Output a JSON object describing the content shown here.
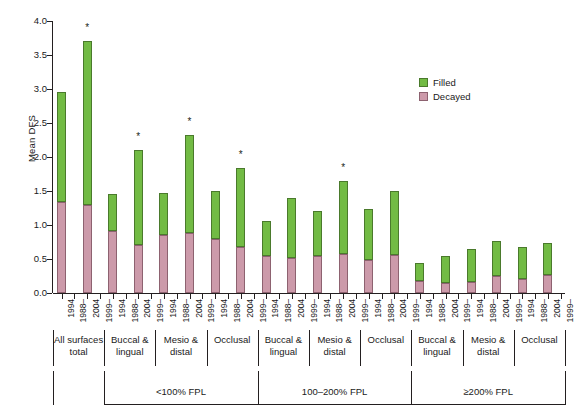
{
  "chart_data": {
    "type": "bar",
    "subtype": "stacked-bar",
    "title": "",
    "xlabel": "",
    "ylabel": "Mean DFS",
    "ylim": [
      0.0,
      4.0
    ],
    "ytick_labels": [
      "0.0",
      "0.5",
      "1.0",
      "1.5",
      "2.0",
      "2.5",
      "3.0",
      "3.5",
      "4.0"
    ],
    "ytick_values": [
      0.0,
      0.5,
      1.0,
      1.5,
      2.0,
      2.5,
      3.0,
      3.5,
      4.0
    ],
    "grid": false,
    "legend_position": "upper right",
    "series": [
      {
        "name": "Filled",
        "color": "#72bb44"
      },
      {
        "name": "Decayed",
        "color": "#cc9aaa"
      }
    ],
    "annotation_note": "* denotes statistically significant change",
    "categories": [
      "1994",
      "1988–",
      "2004",
      "1999–"
    ],
    "groups": [
      {
        "income": "",
        "surface_groups": [
          {
            "surface": "All surfaces total",
            "bars": [
              {
                "year": "1994",
                "decayed": 1.34,
                "filled": 1.61,
                "total": 2.95,
                "star": false
              },
              {
                "year": "1988–",
                "decayed": 0.0,
                "filled": 0.0,
                "total": 0.0,
                "star": false,
                "spacer": true
              },
              {
                "year": "2004",
                "decayed": 1.29,
                "filled": 2.42,
                "total": 3.71,
                "star": true
              },
              {
                "year": "1999–",
                "decayed": 0.0,
                "filled": 0.0,
                "total": 0.0,
                "star": false,
                "spacer": true
              }
            ]
          }
        ]
      },
      {
        "income": "<100% FPL",
        "surface_groups": [
          {
            "surface": "Buccal & lingual",
            "bars": [
              {
                "year": "1994",
                "decayed": 0.91,
                "filled": 0.55,
                "total": 1.46,
                "star": false
              },
              {
                "year": "1988–",
                "spacer": true
              },
              {
                "year": "2004",
                "decayed": 0.7,
                "filled": 1.41,
                "total": 2.11,
                "star": true
              },
              {
                "year": "1999–",
                "spacer": true
              }
            ]
          },
          {
            "surface": "Mesio & distal",
            "bars": [
              {
                "year": "1994",
                "decayed": 0.86,
                "filled": 0.61,
                "total": 1.47,
                "star": false
              },
              {
                "year": "1988–",
                "spacer": true
              },
              {
                "year": "2004",
                "decayed": 0.88,
                "filled": 1.45,
                "total": 2.33,
                "star": true
              },
              {
                "year": "1999–",
                "spacer": true
              }
            ]
          },
          {
            "surface": "Occlusal",
            "bars": [
              {
                "year": "1994",
                "decayed": 0.8,
                "filled": 0.7,
                "total": 1.5,
                "star": false
              },
              {
                "year": "1988–",
                "spacer": true
              },
              {
                "year": "2004",
                "decayed": 0.67,
                "filled": 1.17,
                "total": 1.84,
                "star": true
              },
              {
                "year": "1999–",
                "spacer": true
              }
            ]
          }
        ]
      },
      {
        "income": "100–200% FPL",
        "surface_groups": [
          {
            "surface": "Buccal & lingual",
            "bars": [
              {
                "year": "1994",
                "decayed": 0.54,
                "filled": 0.52,
                "total": 1.06,
                "star": false
              },
              {
                "year": "1988–",
                "spacer": true
              },
              {
                "year": "2004",
                "decayed": 0.52,
                "filled": 0.88,
                "total": 1.4,
                "star": false
              },
              {
                "year": "1999–",
                "spacer": true
              }
            ]
          },
          {
            "surface": "Mesio & distal",
            "bars": [
              {
                "year": "1994",
                "decayed": 0.55,
                "filled": 0.65,
                "total": 1.2,
                "star": false
              },
              {
                "year": "1988–",
                "spacer": true
              },
              {
                "year": "2004",
                "decayed": 0.57,
                "filled": 1.08,
                "total": 1.65,
                "star": true
              },
              {
                "year": "1999–",
                "spacer": true
              }
            ]
          },
          {
            "surface": "Occlusal",
            "bars": [
              {
                "year": "1994",
                "decayed": 0.48,
                "filled": 0.75,
                "total": 1.23,
                "star": false
              },
              {
                "year": "1988–",
                "spacer": true
              },
              {
                "year": "2004",
                "decayed": 0.56,
                "filled": 0.94,
                "total": 1.5,
                "star": false
              },
              {
                "year": "1999–",
                "spacer": true
              }
            ]
          }
        ]
      },
      {
        "income": "≥200% FPL",
        "surface_groups": [
          {
            "surface": "Buccal & lingual",
            "bars": [
              {
                "year": "1994",
                "decayed": 0.17,
                "filled": 0.27,
                "total": 0.44,
                "star": false
              },
              {
                "year": "1988–",
                "spacer": true
              },
              {
                "year": "2004",
                "decayed": 0.14,
                "filled": 0.41,
                "total": 0.55,
                "star": false
              },
              {
                "year": "1999–",
                "spacer": true
              }
            ]
          },
          {
            "surface": "Mesio & distal",
            "bars": [
              {
                "year": "1994",
                "decayed": 0.16,
                "filled": 0.49,
                "total": 0.65,
                "star": false
              },
              {
                "year": "1988–",
                "spacer": true
              },
              {
                "year": "2004",
                "decayed": 0.25,
                "filled": 0.51,
                "total": 0.76,
                "star": false
              },
              {
                "year": "1999–",
                "spacer": true
              }
            ]
          },
          {
            "surface": "Occlusal",
            "bars": [
              {
                "year": "1994",
                "decayed": 0.21,
                "filled": 0.47,
                "total": 0.68,
                "star": false
              },
              {
                "year": "1988–",
                "spacer": true
              },
              {
                "year": "2004",
                "decayed": 0.27,
                "filled": 0.46,
                "total": 0.73,
                "star": false
              },
              {
                "year": "1999–",
                "spacer": true
              }
            ]
          }
        ]
      }
    ],
    "bar_order_years": [
      "1994",
      "1988–",
      "2004",
      "1999–",
      "1994",
      "1988–",
      "2004",
      "1999–",
      "1994",
      "1988–",
      "2004",
      "1999–",
      "1994",
      "1988–",
      "2004",
      "1999–",
      "1994",
      "1988–",
      "2004",
      "1999–",
      "1994",
      "1988–",
      "2004",
      "1999–",
      "1994",
      "1988–",
      "2004",
      "1999–",
      "1994",
      "1988–",
      "2004",
      "1999–",
      "1994",
      "1988–",
      "2004",
      "1999–",
      "1994",
      "1988–",
      "2004",
      "1999–"
    ],
    "surface_labels": [
      "All surfaces total",
      "Buccal & lingual",
      "Mesio & distal",
      "Occlusal",
      "Buccal & lingual",
      "Mesio & distal",
      "Occlusal",
      "Buccal & lingual",
      "Mesio & distal",
      "Occlusal"
    ],
    "income_labels": [
      "<100% FPL",
      "100–200% FPL",
      "≥200% FPL"
    ]
  },
  "legend": {
    "items": [
      {
        "label": "Filled",
        "color": "#72bb44"
      },
      {
        "label": "Decayed",
        "color": "#cc9aaa"
      }
    ]
  },
  "axis": {
    "y_title": "Mean DFS"
  }
}
